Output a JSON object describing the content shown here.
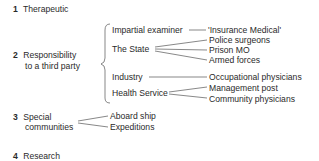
{
  "diagram": {
    "categories": [
      {
        "num": "1",
        "label": "Therapeutic"
      },
      {
        "num": "2",
        "label_line1": "Responsibility",
        "label_line2": "to a third party",
        "children": [
          {
            "label": "Impartial examiner",
            "children": [
              "'Insurance Medical'"
            ]
          },
          {
            "label": "The State",
            "children": [
              "Police surgeons",
              "Prison MO",
              "Armed forces"
            ]
          },
          {
            "label": "Industry",
            "children": [
              "Occupational physicians"
            ]
          },
          {
            "label": "Health Service",
            "children": [
              "Management post",
              "Community physicians"
            ]
          }
        ]
      },
      {
        "num": "3",
        "label_line1": "Special",
        "label_line2": "communities",
        "children": [
          "Aboard ship",
          "Expeditions"
        ]
      },
      {
        "num": "4",
        "label": "Research"
      }
    ]
  }
}
